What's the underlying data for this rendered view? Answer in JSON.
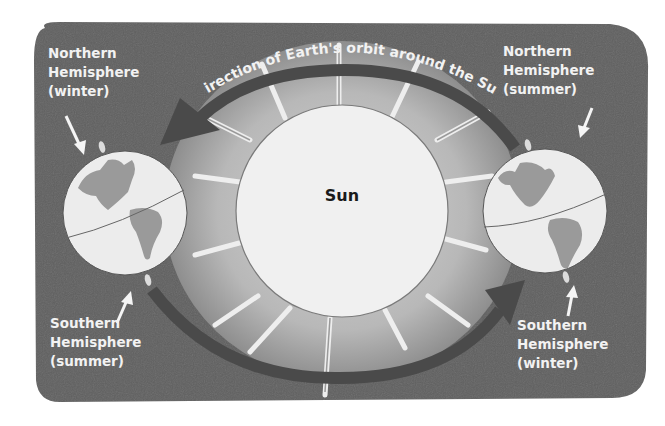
{
  "diagram": {
    "title": "Direction of Earth's orbit around the Sun",
    "sun": {
      "label": "Sun"
    },
    "left_earth": {
      "north_label": [
        "Northern",
        "Hemisphere",
        "(winter)"
      ],
      "south_label": [
        "Southern",
        "Hemisphere",
        "(summer)"
      ]
    },
    "right_earth": {
      "north_label": [
        "Northern",
        "Hemisphere",
        "(summer)"
      ],
      "south_label": [
        "Southern",
        "Hemisphere",
        "(winter)"
      ]
    },
    "colors": {
      "background": "#5f5f5f",
      "sun_glow": "#b5b5b5",
      "sun_disc": "#f0f0f0",
      "orbit_arrow": "#4a4a4a",
      "globe_ocean": "#ececec",
      "globe_land": "#9a9a9a",
      "label_text": "#f2f2f2"
    }
  }
}
